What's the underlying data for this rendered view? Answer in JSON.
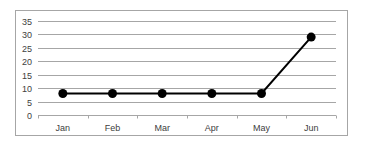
{
  "chart_data": {
    "type": "line",
    "title": "",
    "xlabel": "",
    "ylabel": "",
    "categories": [
      "Jan",
      "Feb",
      "Mar",
      "Apr",
      "May",
      "Jun"
    ],
    "series": [
      {
        "name": "Series 1",
        "values": [
          8,
          8,
          8,
          8,
          8,
          29
        ],
        "color": "#000000",
        "marker": "circle"
      }
    ],
    "ylim": [
      0,
      35
    ],
    "yticks": [
      0,
      5,
      10,
      15,
      20,
      25,
      30,
      35
    ],
    "grid": true,
    "legend": "none"
  },
  "colors": {
    "gridline": "#a6a6a6",
    "line": "#000000",
    "frame": "#a6a6a6",
    "text": "#404040"
  }
}
